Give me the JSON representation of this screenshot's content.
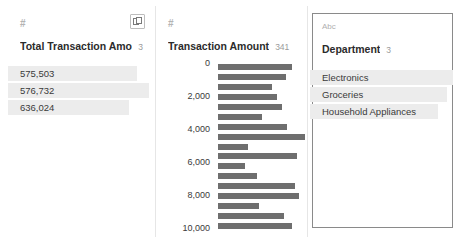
{
  "panes": [
    {
      "id": "total-transaction-amount",
      "type_icon": "#",
      "type_icon_name": "numeric-field-icon",
      "title": "Total Transaction Amou...",
      "count": "3",
      "action_button": "detail-view-button",
      "selected": false,
      "display": "list",
      "values": [
        {
          "label": "575,503",
          "bar_pct": 88
        },
        {
          "label": "576,732",
          "bar_pct": 96
        },
        {
          "label": "636,024",
          "bar_pct": 82
        }
      ]
    },
    {
      "id": "transaction-amount",
      "type_icon": "#",
      "type_icon_name": "numeric-field-icon",
      "title": "Transaction Amount",
      "count": "341",
      "selected": false,
      "display": "histogram"
    },
    {
      "id": "department",
      "type_icon": "Abc",
      "type_icon_name": "text-field-icon",
      "title": "Department",
      "count": "3",
      "selected": true,
      "display": "list",
      "values": [
        {
          "label": "Electronics",
          "bar_pct": 96
        },
        {
          "label": "Groceries",
          "bar_pct": 92
        },
        {
          "label": "Household Appliances",
          "bar_pct": 86
        }
      ]
    }
  ],
  "chart_data": {
    "type": "bar",
    "orientation": "horizontal",
    "title": "Transaction Amount",
    "xlabel": "",
    "ylabel": "",
    "grid": false,
    "legend": null,
    "ylim": [
      0,
      10000
    ],
    "yticks": [
      "0",
      "2,000",
      "4,000",
      "6,000",
      "8,000",
      "10,000"
    ],
    "ytick_values": [
      0,
      2000,
      4000,
      6000,
      8000,
      10000
    ],
    "bin_centers": [
      300,
      900,
      1500,
      2100,
      2700,
      3300,
      3900,
      4500,
      5100,
      5700,
      6300,
      6900,
      7500,
      8100,
      8700,
      9300,
      9900
    ],
    "values": [
      82,
      76,
      60,
      66,
      71,
      49,
      77,
      97,
      33,
      88,
      30,
      44,
      86,
      90,
      46,
      74,
      83
    ]
  },
  "colors": {
    "bar": "#6e6e6e",
    "value_bar": "#ececec",
    "text": "#2b2b2b",
    "muted": "#9a9a9a",
    "border": "#e6e6e6",
    "selected_border": "#8a8a8a"
  }
}
